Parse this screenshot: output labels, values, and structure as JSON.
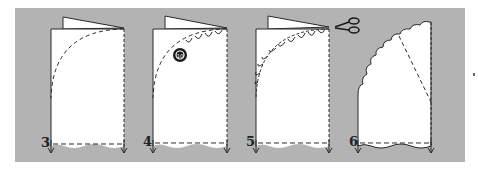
{
  "figure": {
    "background_color": "#b3b3b3",
    "paper_color": "#ffffff",
    "line_color": "#2a2a2a"
  },
  "steps": [
    {
      "number": "3",
      "action": "dashed curve drawn on folded card"
    },
    {
      "number": "4",
      "action": "trace scallops along curve with coin",
      "icon": "coin-icon"
    },
    {
      "number": "5",
      "action": "cut along scalloped line",
      "icon": "scissors-icon"
    },
    {
      "number": "6",
      "action": "unfolded scalloped shape"
    }
  ]
}
